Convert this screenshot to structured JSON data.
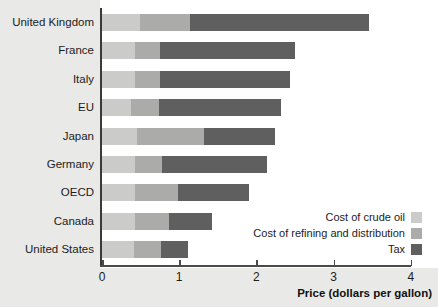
{
  "chart_data": {
    "type": "bar",
    "orientation": "horizontal",
    "stacked": true,
    "title": "",
    "xlabel": "Price (dollars per gallon)",
    "ylabel": "",
    "xlim": [
      0,
      4
    ],
    "xticks": [
      0,
      1,
      2,
      3,
      4
    ],
    "xtick_labels": [
      "0",
      "1",
      "2",
      "3",
      "4"
    ],
    "grid": false,
    "legend_position": "inside-lower-right",
    "categories": [
      "United Kingdom",
      "France",
      "Italy",
      "EU",
      "Japan",
      "Germany",
      "OECD",
      "Canada",
      "United States"
    ],
    "series": [
      {
        "name": "Cost of crude oil",
        "color": "#cbcbc9",
        "values": [
          0.49,
          0.43,
          0.43,
          0.37,
          0.45,
          0.43,
          0.43,
          0.43,
          0.42
        ]
      },
      {
        "name": "Cost of refining and distribution",
        "color": "#ababa9",
        "values": [
          0.65,
          0.32,
          0.32,
          0.37,
          0.87,
          0.35,
          0.55,
          0.44,
          0.34
        ]
      },
      {
        "name": "Tax",
        "color": "#5f5f5f",
        "values": [
          2.32,
          1.75,
          1.68,
          1.58,
          0.92,
          1.36,
          0.93,
          0.56,
          0.35
        ]
      }
    ],
    "totals": [
      3.46,
      2.5,
      2.43,
      2.32,
      2.24,
      2.14,
      1.91,
      1.43,
      1.11
    ]
  },
  "legend": {
    "items": [
      {
        "label": "Cost of crude oil",
        "swatch": "crude"
      },
      {
        "label": "Cost of refining and distribution",
        "swatch": "refining"
      },
      {
        "label": "Tax",
        "swatch": "tax"
      }
    ]
  },
  "colors": {
    "crude": "#cbcbc9",
    "refining": "#ababa9",
    "tax": "#5f5f5f",
    "label_band": "#e9e9e7",
    "axis": "#4a4a4a",
    "plot_background": "#ffffff"
  }
}
